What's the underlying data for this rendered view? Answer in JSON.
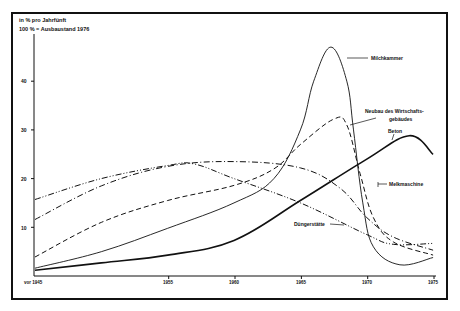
{
  "chart_data": {
    "type": "line",
    "title": "in % pro Jahrfünft",
    "subtitle": "100 % = Ausbaustand 1976",
    "xlabel": "",
    "ylabel": "in % pro Jahrfünft",
    "x_ticks": [
      "vor 1945",
      "1955",
      "1960",
      "1965",
      "1970",
      "1975"
    ],
    "y_ticks": [
      10,
      20,
      30,
      40
    ],
    "xlim": [
      1945,
      1975
    ],
    "ylim": [
      0,
      50
    ],
    "grid": false,
    "legend": "inline labels",
    "series": [
      {
        "name": "Milchkammer",
        "style": "solid-thin",
        "x": [
          1945,
          1950,
          1955,
          1960,
          1963,
          1965,
          1966,
          1967.3,
          1968.5,
          1969,
          1969.7,
          1970.5,
          1972.5,
          1975
        ],
        "values": [
          1.6,
          5,
          9.8,
          15,
          20,
          30,
          40,
          47,
          40,
          30,
          15,
          6,
          2.3,
          3.8
        ]
      },
      {
        "name": "Neubau des Wirtschaftsgebäudes",
        "style": "dashed",
        "x": [
          1945,
          1950,
          1955,
          1960,
          1963,
          1965,
          1967.5,
          1968.5,
          1969.5,
          1970.5,
          1972,
          1975
        ],
        "values": [
          3.9,
          11,
          15.5,
          18.6,
          22,
          27,
          32.2,
          31,
          21,
          12,
          7,
          4.3
        ]
      },
      {
        "name": "Beton",
        "style": "solid-thick",
        "x": [
          1945,
          1950,
          1955,
          1960,
          1965,
          1970,
          1973.2,
          1975
        ],
        "values": [
          1.2,
          2.7,
          4.3,
          7.3,
          15.5,
          24,
          28.8,
          25
        ]
      },
      {
        "name": "Melkmaschine",
        "style": "dash-dot",
        "x": [
          1945,
          1950,
          1955,
          1960,
          1965,
          1968,
          1970,
          1972,
          1975
        ],
        "values": [
          11.6,
          18.5,
          22.5,
          23.5,
          22.2,
          18,
          12,
          8,
          5.3
        ]
      },
      {
        "name": "Düngerstätte",
        "style": "dash-dot-dot",
        "x": [
          1945,
          1950,
          1955,
          1957,
          1960,
          1965,
          1970,
          1972,
          1975
        ],
        "values": [
          15.7,
          20,
          22.7,
          23,
          20,
          15,
          8.5,
          6.5,
          6.7
        ]
      }
    ],
    "labels": {
      "milchkammer": "Milchkammer",
      "neubau_1": "Neubau des Wirtschafts-",
      "neubau_2": "gebäudes",
      "beton": "Beton",
      "melkmaschine": "Melkmaschine",
      "duengerstaette": "Düngerstätte"
    }
  },
  "header": {
    "line1": "in % pro Jahrfünft",
    "line2": "100 % = Ausbaustand 1976"
  },
  "axis": {
    "y": [
      "10",
      "20",
      "30",
      "40"
    ],
    "x": [
      "vor 1945",
      "1955",
      "1960",
      "1965",
      "1970",
      "1975"
    ]
  }
}
